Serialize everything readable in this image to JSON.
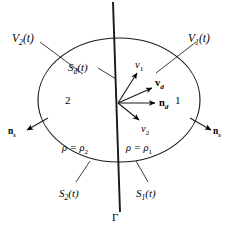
{
  "figure": {
    "type": "continuum-mechanics-diagram",
    "background_color": "#ffffff",
    "stroke_color": "#000000"
  },
  "boundary": {
    "shape": "ellipse",
    "center_x": 119,
    "center_y": 100,
    "radius_x": 81,
    "radius_y": 62
  },
  "discontinuity_line": {
    "name": "gamma-line",
    "x_top": 113,
    "y_top": 2,
    "x_bottom": 120,
    "y_bottom": 212,
    "label": "Γ"
  },
  "volumes": [
    {
      "key": "v2",
      "label": "V",
      "sub": "2",
      "suffix": "(t)",
      "x": 12,
      "y": 33
    },
    {
      "key": "v1",
      "label": "V",
      "sub": "1",
      "suffix": "(t)",
      "x": 188,
      "y": 33
    }
  ],
  "surfaces": [
    {
      "key": "sd",
      "label": "S",
      "sub": "d",
      "suffix": "(t)",
      "x": 68,
      "y": 62
    },
    {
      "key": "s2",
      "label": "S",
      "sub": "2",
      "suffix": "(t)",
      "x": 59,
      "y": 188
    },
    {
      "key": "s1",
      "label": "S",
      "sub": "1",
      "suffix": "(t)",
      "x": 136,
      "y": 188
    }
  ],
  "regions": [
    {
      "key": "region2",
      "label": "2",
      "x": 65,
      "y": 95
    },
    {
      "key": "region1",
      "label": "1",
      "x": 175,
      "y": 95
    }
  ],
  "vectors": [
    {
      "key": "v1",
      "label": "v",
      "sub": "1",
      "bold": false,
      "label_x": 135,
      "label_y": 60,
      "x1": 118,
      "y1": 103,
      "x2": 137,
      "y2": 73
    },
    {
      "key": "vd",
      "label": "v",
      "sub": "d",
      "bold": true,
      "label_x": 155,
      "label_y": 78,
      "x1": 118,
      "y1": 103,
      "x2": 152,
      "y2": 88
    },
    {
      "key": "nd",
      "label": "n",
      "sub": "d",
      "bold": true,
      "label_x": 159,
      "label_y": 98,
      "x1": 118,
      "y1": 103,
      "x2": 155,
      "y2": 103
    },
    {
      "key": "v2",
      "label": "v",
      "sub": "2",
      "bold": false,
      "label_x": 141,
      "label_y": 124,
      "x1": 118,
      "y1": 103,
      "x2": 139,
      "y2": 120
    }
  ],
  "normals": [
    {
      "key": "n-left",
      "label": "n",
      "sub": "s",
      "label_x": 8,
      "label_y": 127,
      "x1": 48,
      "y1": 118,
      "x2": 27,
      "y2": 130
    },
    {
      "key": "n-right",
      "label": "n",
      "sub": "s",
      "label_x": 213,
      "label_y": 127,
      "x1": 190,
      "y1": 118,
      "x2": 211,
      "y2": 130
    }
  ],
  "densities": [
    {
      "key": "rho2",
      "lhs": "ρ",
      "eq": " = ",
      "rhs": "ρ",
      "sub": "2",
      "x": 62,
      "y": 143
    },
    {
      "key": "rho1",
      "lhs": "ρ",
      "eq": " = ",
      "rhs": "ρ",
      "sub": "1",
      "x": 126,
      "y": 143
    }
  ],
  "leaders": [
    {
      "key": "leader-v2",
      "x1": 40,
      "y1": 42,
      "x2": 83,
      "y2": 74
    },
    {
      "key": "leader-v1",
      "x1": 196,
      "y1": 42,
      "x2": 156,
      "y2": 73
    },
    {
      "key": "leader-sd",
      "x1": 98,
      "y1": 68,
      "x2": 116,
      "y2": 79
    },
    {
      "key": "leader-s2",
      "x1": 76,
      "y1": 182,
      "x2": 90,
      "y2": 161
    },
    {
      "key": "leader-s1",
      "x1": 148,
      "y1": 182,
      "x2": 136,
      "y2": 161
    }
  ],
  "gamma": {
    "label": "Γ",
    "x": 112,
    "y": 212
  }
}
